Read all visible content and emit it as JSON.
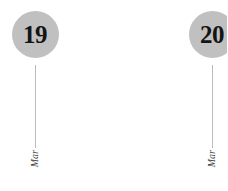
{
  "canvas": {
    "width": 227,
    "height": 191,
    "background_color": "#ffffff"
  },
  "style": {
    "bubble_fill": "#c0c0c0",
    "bubble_text_color": "#141414",
    "stem_color": "#bcbcbc",
    "month_text_color": "#3a3a3a"
  },
  "markers": [
    {
      "day": "19",
      "month": "Mar",
      "center_x": 35,
      "clipped": false
    },
    {
      "day": "20",
      "month": "Mar",
      "center_x": 212,
      "clipped": true
    }
  ]
}
